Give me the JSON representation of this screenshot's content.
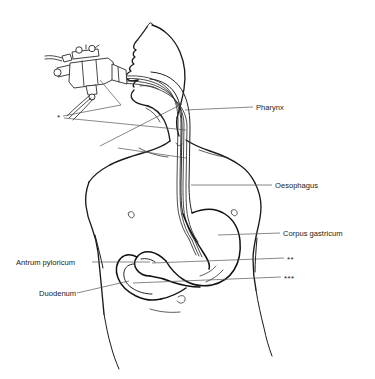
{
  "figure": {
    "background_color": "#ffffff",
    "line_color": "#1a1a1a",
    "label_color": "#1a1a1a",
    "leader_color": "#555555"
  },
  "labels": {
    "pharynx": "Pharynx",
    "oesophagus": "Oesophagus",
    "corpus_gastricum": "Corpus gastricum",
    "antrum_pyloricum": "Antrum pyloricum",
    "duodenum": "Duodenum"
  },
  "markers": {
    "one": "*",
    "two": "**",
    "three": "***"
  },
  "parts": {
    "endoscope": "endoscope-control-handle",
    "insertion_tube": "endoscope-insertion-tube",
    "head": "patient-head-profile",
    "torso": "patient-torso-outline",
    "stomach": "stomach-outline",
    "duodenum_loop": "duodenum-loop"
  }
}
